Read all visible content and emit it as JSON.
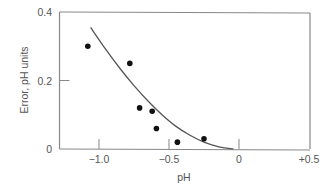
{
  "chart_data": {
    "type": "scatter",
    "title": "",
    "xlabel": "pH",
    "ylabel": "Error, pH units",
    "xlim": [
      -1.29,
      0.51
    ],
    "ylim": [
      0,
      0.4
    ],
    "x_ticks": [
      -1.0,
      -0.5,
      0,
      0.5
    ],
    "x_tick_labels": [
      "−1.0",
      "−0.5",
      "0",
      "+0.5"
    ],
    "y_ticks": [
      0,
      0.2,
      0.4
    ],
    "y_tick_labels": [
      "0",
      "0.2",
      "0.4"
    ],
    "grid": false,
    "legend": null,
    "series": [
      {
        "name": "measured",
        "kind": "scatter",
        "x": [
          -1.08,
          -0.78,
          -0.71,
          -0.62,
          -0.59,
          -0.44,
          -0.25
        ],
        "y": [
          0.3,
          0.25,
          0.12,
          0.11,
          0.06,
          0.02,
          0.03
        ]
      },
      {
        "name": "fit",
        "kind": "line",
        "x": [
          -1.06,
          -0.95,
          -0.85,
          -0.75,
          -0.65,
          -0.55,
          -0.45,
          -0.35,
          -0.25,
          -0.15,
          -0.04
        ],
        "y": [
          0.355,
          0.29,
          0.235,
          0.185,
          0.14,
          0.1,
          0.066,
          0.04,
          0.02,
          0.007,
          0.0
        ]
      }
    ]
  },
  "colors": {
    "axis": "#888888",
    "curve": "#555555",
    "points": "#111111",
    "text": "#555555"
  }
}
